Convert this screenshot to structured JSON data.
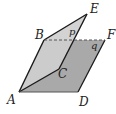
{
  "diagram": {
    "type": "geometry",
    "colors": {
      "plane_q_fill": "#a9a9a9",
      "plane_p_fill": "#cfcfcf",
      "edge": "#1a1a1a",
      "dashed_edge": "#555555",
      "background": "#ffffff"
    },
    "points": {
      "A": {
        "label": "A",
        "x": 19,
        "y": 92
      },
      "B": {
        "label": "B",
        "x": 44,
        "y": 40
      },
      "C": {
        "label": "C",
        "x": 59,
        "y": 69
      },
      "D": {
        "label": "D",
        "x": 78,
        "y": 92
      },
      "E": {
        "label": "E",
        "x": 87,
        "y": 14
      },
      "F": {
        "label": "F",
        "x": 105,
        "y": 40
      }
    },
    "planes": [
      {
        "name": "p",
        "label": "p",
        "vertices": [
          "A",
          "B",
          "E",
          "C"
        ]
      },
      {
        "name": "q",
        "label": "q",
        "vertices": [
          "A",
          "D",
          "F",
          "B"
        ]
      }
    ],
    "segments": [
      {
        "from": "A",
        "to": "B",
        "style": "solid"
      },
      {
        "from": "B",
        "to": "E",
        "style": "solid"
      },
      {
        "from": "E",
        "to": "C",
        "style": "solid"
      },
      {
        "from": "A",
        "to": "C",
        "style": "solid"
      },
      {
        "from": "A",
        "to": "D",
        "style": "solid"
      },
      {
        "from": "D",
        "to": "F",
        "style": "solid"
      },
      {
        "from": "B",
        "to": "F",
        "style": "dashed"
      }
    ],
    "labels": {
      "A": "A",
      "B": "B",
      "C": "C",
      "D": "D",
      "E": "E",
      "F": "F",
      "p": "p",
      "q": "q"
    }
  }
}
